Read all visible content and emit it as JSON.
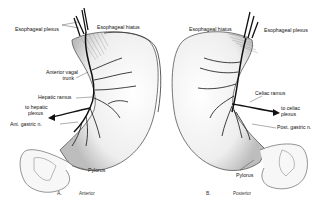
{
  "figure": {
    "panels": [
      {
        "id": "A",
        "letter": "A.",
        "view": "Anterior",
        "labels": {
          "esophageal_plexus": "Esophageal plexus",
          "esophageal_hiatus": "Esophageal hiatus",
          "anterior_vagal_trunk_1": "Anterior vagal",
          "anterior_vagal_trunk_2": "trunk",
          "hepatic_ramus": "Hepatic ramus",
          "to_hepatic_plexus_1": "to hepatic",
          "to_hepatic_plexus_2": "plexus",
          "ant_gastric_n": "Ant. gastric n.",
          "pylorus": "Pylorus"
        }
      },
      {
        "id": "B",
        "letter": "B.",
        "view": "Posterior",
        "labels": {
          "esophageal_hiatus": "Esophageal hiatus",
          "esophageal_plexus": "Esophageal plexus",
          "celiac_ramus": "Celiac ramus",
          "to_celiac_plexus_1": "to celiac",
          "to_celiac_plexus_2": "plexus",
          "post_gastric_n": "Post. gastric n.",
          "pylorus": "Pylorus"
        }
      }
    ],
    "colors": {
      "ink": "#111111",
      "outline": "#555555",
      "shade": "#cfcfcf"
    }
  }
}
